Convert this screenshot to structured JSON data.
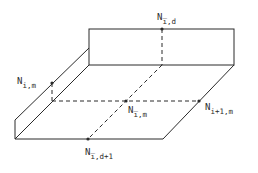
{
  "diagram": {
    "type": "3d-control-volume",
    "stroke_color": "#2a2a2a",
    "background": "#ffffff",
    "labels": [
      {
        "id": "top",
        "base": "N",
        "sub": "i̅,d",
        "x": 157,
        "y": 20
      },
      {
        "id": "left",
        "base": "N",
        "sub": "i,m",
        "x": 17,
        "y": 84
      },
      {
        "id": "center",
        "base": "N",
        "sub": "i̅,m",
        "x": 128,
        "y": 113
      },
      {
        "id": "right",
        "base": "N",
        "sub": "i+1,m",
        "x": 205,
        "y": 110
      },
      {
        "id": "bottom",
        "base": "N",
        "sub": "i̅,d+1",
        "x": 85,
        "y": 155
      }
    ],
    "nodes": [
      {
        "id": "node-top",
        "x": 162,
        "y": 29
      },
      {
        "id": "node-left",
        "x": 52,
        "y": 83
      },
      {
        "id": "node-center",
        "x": 126,
        "y": 101
      },
      {
        "id": "node-right",
        "x": 199,
        "y": 101
      },
      {
        "id": "node-bottom",
        "x": 88,
        "y": 139
      }
    ]
  }
}
